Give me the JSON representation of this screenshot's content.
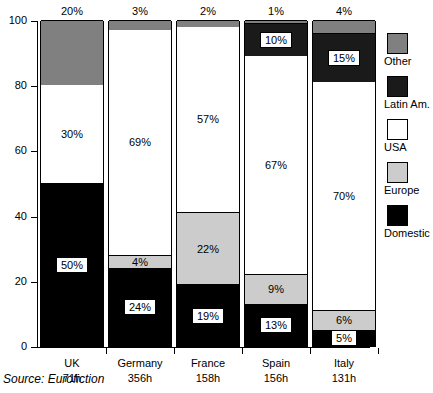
{
  "chart_data": {
    "type": "bar",
    "subtype": "stacked-percentage",
    "title": "",
    "xlabel": "",
    "ylabel": "",
    "ylim": [
      0,
      100
    ],
    "ytick_labels": [
      "0",
      "20",
      "40",
      "60",
      "80",
      "100"
    ],
    "ytick_values": [
      0,
      20,
      40,
      60,
      80,
      100
    ],
    "grid": false,
    "legend_position": "right",
    "categories": [
      "UK",
      "Germany",
      "France",
      "Spain",
      "Italy"
    ],
    "category_sublabels": [
      "71h",
      "356h",
      "158h",
      "156h",
      "131h"
    ],
    "series": [
      {
        "name": "Domestic",
        "color": "#000000",
        "values": [
          50,
          24,
          19,
          13,
          5
        ]
      },
      {
        "name": "Europe",
        "color": "#cccccc",
        "values": [
          0,
          4,
          22,
          9,
          6
        ]
      },
      {
        "name": "USA",
        "color": "#ffffff",
        "values": [
          30,
          69,
          57,
          67,
          70
        ]
      },
      {
        "name": "Latin Am.",
        "color": "#1a1a1a",
        "values": [
          0,
          0,
          0,
          10,
          15
        ]
      },
      {
        "name": "Other",
        "color": "#808080",
        "values": [
          20,
          3,
          2,
          1,
          4
        ]
      }
    ],
    "top_annotations": [
      "20%",
      "3%",
      "2%",
      "1%",
      "4%"
    ],
    "bar_labels": {
      "UK": [
        {
          "series": "Domestic",
          "text": "50%",
          "style": "boxed"
        },
        {
          "series": "USA",
          "text": "30%",
          "style": "plain"
        }
      ],
      "Germany": [
        {
          "series": "Domestic",
          "text": "24%",
          "style": "boxed"
        },
        {
          "series": "Europe",
          "text": "4%",
          "style": "plain"
        },
        {
          "series": "USA",
          "text": "69%",
          "style": "plain"
        }
      ],
      "France": [
        {
          "series": "Domestic",
          "text": "19%",
          "style": "boxed"
        },
        {
          "series": "Europe",
          "text": "22%",
          "style": "plain"
        },
        {
          "series": "USA",
          "text": "57%",
          "style": "plain"
        }
      ],
      "Spain": [
        {
          "series": "Domestic",
          "text": "13%",
          "style": "boxed"
        },
        {
          "series": "Europe",
          "text": "9%",
          "style": "plain"
        },
        {
          "series": "USA",
          "text": "67%",
          "style": "plain"
        },
        {
          "series": "Latin Am.",
          "text": "10%",
          "style": "boxed"
        }
      ],
      "Italy": [
        {
          "series": "Domestic",
          "text": "5%",
          "style": "boxed"
        },
        {
          "series": "Europe",
          "text": "6%",
          "style": "plain"
        },
        {
          "series": "USA",
          "text": "70%",
          "style": "plain"
        },
        {
          "series": "Latin Am.",
          "text": "15%",
          "style": "boxed"
        }
      ]
    },
    "source": "Source: Eurofiction"
  },
  "legend": {
    "items": [
      {
        "label": "Other",
        "color": "#808080"
      },
      {
        "label": "Latin Am.",
        "color": "#1a1a1a"
      },
      {
        "label": "USA",
        "color": "#ffffff"
      },
      {
        "label": "Europe",
        "color": "#cccccc"
      },
      {
        "label": "Domestic",
        "color": "#000000"
      }
    ]
  },
  "source_note": "Source: Eurofiction"
}
